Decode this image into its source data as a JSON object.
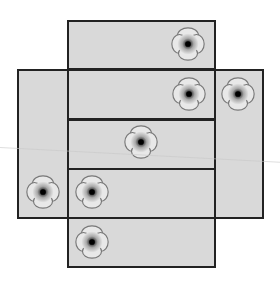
{
  "diagram": {
    "type": "cube-net",
    "face_color": "#d9d9d9",
    "border_color": "#222222",
    "faces": [
      {
        "id": "top",
        "x": 67,
        "y": 20,
        "w": 149,
        "h": 50
      },
      {
        "id": "left",
        "x": 17,
        "y": 69,
        "w": 52,
        "h": 150
      },
      {
        "id": "right",
        "x": 214,
        "y": 69,
        "w": 50,
        "h": 150
      },
      {
        "id": "middle-1",
        "x": 67,
        "y": 69,
        "w": 149,
        "h": 51
      },
      {
        "id": "middle-2",
        "x": 67,
        "y": 119,
        "w": 149,
        "h": 51
      },
      {
        "id": "middle-3",
        "x": 67,
        "y": 168,
        "w": 149,
        "h": 51
      },
      {
        "id": "bottom",
        "x": 67,
        "y": 217,
        "w": 149,
        "h": 51
      }
    ],
    "flowers": [
      {
        "x": 188,
        "y": 44
      },
      {
        "x": 189,
        "y": 94
      },
      {
        "x": 238,
        "y": 94
      },
      {
        "x": 141,
        "y": 142
      },
      {
        "x": 43,
        "y": 192
      },
      {
        "x": 92,
        "y": 192
      },
      {
        "x": 92,
        "y": 242
      }
    ],
    "flower_icon": "poppy-flower-icon"
  }
}
